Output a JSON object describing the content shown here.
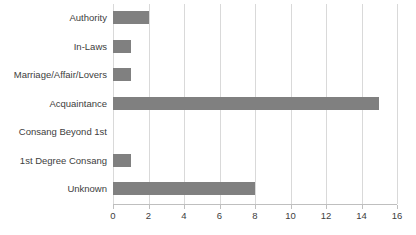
{
  "chart_data": {
    "type": "bar",
    "orientation": "horizontal",
    "title": "",
    "subtitle": "",
    "xlabel": "",
    "ylabel": "",
    "categories": [
      "Authority",
      "In-Laws",
      "Marriage/Affair/Lovers",
      "Acquaintance",
      "Consang Beyond 1st",
      "1st Degree Consang",
      "Unknown"
    ],
    "values": [
      2,
      1,
      1,
      15,
      0,
      1,
      8
    ],
    "xlim": [
      0,
      16
    ],
    "xticks": [
      0,
      2,
      4,
      6,
      8,
      10,
      12,
      14,
      16
    ],
    "xtick_labels": [
      "0",
      "2",
      "4",
      "6",
      "8",
      "10",
      "12",
      "14",
      "16"
    ],
    "grid": "vertical",
    "legend": "none",
    "series": [
      {
        "name": "",
        "values": [
          2,
          1,
          1,
          15,
          0,
          1,
          8
        ]
      }
    ]
  },
  "colors": {
    "bar": "#808080",
    "gridline": "#d9d9d9",
    "axis": "#bfbfbf",
    "text": "#404040",
    "background": "#ffffff"
  }
}
